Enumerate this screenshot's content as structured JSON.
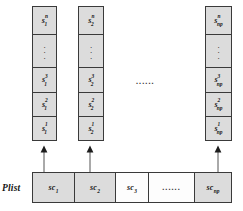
{
  "figure": {
    "plist_label": "Plist",
    "mid_ellipsis": "......",
    "vertical_ellipsis": "⋮",
    "colors": {
      "cell_fill": "#dcdcdc",
      "cell_empty_fill": "#fdfdfd",
      "border": "#3a3a3a",
      "text": "#161616",
      "background": "#ffffff"
    }
  },
  "stacks": [
    {
      "id": "stack-1",
      "cells": [
        {
          "kind": "symbol",
          "base": "s",
          "sup": "n",
          "sub": "1",
          "text": "s₁ⁿ"
        },
        {
          "kind": "vdots",
          "text": "⋮"
        },
        {
          "kind": "symbol",
          "base": "s",
          "sup": "3",
          "sub": "1",
          "text": "s₁³"
        },
        {
          "kind": "symbol",
          "base": "s",
          "sup": "2",
          "sub": "1",
          "text": "s₁²"
        },
        {
          "kind": "symbol",
          "base": "s",
          "sup": "1",
          "sub": "1",
          "text": "s₁¹"
        }
      ]
    },
    {
      "id": "stack-2",
      "cells": [
        {
          "kind": "symbol",
          "base": "s",
          "sup": "n",
          "sub": "2",
          "text": "s₂ⁿ"
        },
        {
          "kind": "vdots",
          "text": "⋮"
        },
        {
          "kind": "symbol",
          "base": "s",
          "sup": "3",
          "sub": "2",
          "text": "s₂³"
        },
        {
          "kind": "symbol",
          "base": "s",
          "sup": "2",
          "sub": "2",
          "text": "s₂²"
        },
        {
          "kind": "symbol",
          "base": "s",
          "sup": "1",
          "sub": "2",
          "text": "s₂¹"
        }
      ]
    },
    {
      "id": "stack-np",
      "cells": [
        {
          "kind": "symbol",
          "base": "s",
          "sup": "n",
          "sub": "np",
          "text": "s_np^n"
        },
        {
          "kind": "vdots",
          "text": "⋮"
        },
        {
          "kind": "symbol",
          "base": "s",
          "sup": "3",
          "sub": "np",
          "text": "s_np^3"
        },
        {
          "kind": "symbol",
          "base": "s",
          "sup": "2",
          "sub": "np",
          "text": "s_np^2"
        },
        {
          "kind": "symbol",
          "base": "s",
          "sup": "1",
          "sub": "np",
          "text": "s_np^1"
        }
      ]
    }
  ],
  "plist_cells": [
    {
      "id": "sc-1",
      "kind": "symbol",
      "base": "sc",
      "sub": "1",
      "filled": true,
      "text": "sc₁"
    },
    {
      "id": "sc-2",
      "kind": "symbol",
      "base": "sc",
      "sub": "2",
      "filled": true,
      "text": "sc₂"
    },
    {
      "id": "sc-3",
      "kind": "symbol",
      "base": "sc",
      "sub": "3",
      "filled": false,
      "text": "sc₃"
    },
    {
      "id": "sc-gap",
      "kind": "dots",
      "base": "",
      "sub": "",
      "filled": false,
      "text": "......"
    },
    {
      "id": "sc-np",
      "kind": "symbol",
      "base": "sc",
      "sub": "np",
      "filled": true,
      "text": "sc_np"
    }
  ],
  "arrows": [
    {
      "id": "arrow-to-stack-1",
      "from": "sc-1",
      "to": "stack-1"
    },
    {
      "id": "arrow-to-stack-2",
      "from": "sc-2",
      "to": "stack-2"
    },
    {
      "id": "arrow-to-stack-np",
      "from": "sc-np",
      "to": "stack-np"
    }
  ]
}
